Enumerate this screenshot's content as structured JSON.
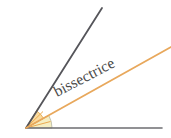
{
  "figure": {
    "background_color": "#ffffff",
    "label": "bissectrice",
    "label_color": "#4a4a4a",
    "label_rotation_degrees": -27.5,
    "label_position": {
      "x": 57,
      "y": 97
    }
  },
  "geometry": {
    "vertex": {
      "x": 26,
      "y": 128
    },
    "rays": [
      {
        "name": "baseline-ray",
        "from": {
          "x": 26,
          "y": 128
        },
        "to": {
          "x": 162,
          "y": 128
        },
        "color": "#6e6e72",
        "width": 1.6
      },
      {
        "name": "upper-ray",
        "from": {
          "x": 26,
          "y": 128
        },
        "to": {
          "x": 102,
          "y": 8
        },
        "color": "#55555a",
        "width": 1.8
      },
      {
        "name": "bisector-ray",
        "from": {
          "x": 26,
          "y": 128
        },
        "to": {
          "x": 171,
          "y": 47
        },
        "color": "#e8a85c",
        "width": 1.8
      }
    ],
    "angle_marks": [
      {
        "name": "lower-angle-sector",
        "fill": "#f4edbe",
        "stroke": "#b9b9a8",
        "radius": 26,
        "start_angle_degrees": 0,
        "end_angle_degrees": 29
      },
      {
        "name": "upper-angle-sector",
        "fill": "#f9d89a",
        "stroke": "#e0a84e",
        "radius": 20,
        "start_angle_degrees": 29,
        "end_angle_degrees": 58
      }
    ],
    "tick_rays": {
      "name": "angle-hatch-rays",
      "color": "#e9a94e",
      "count": 4
    }
  }
}
